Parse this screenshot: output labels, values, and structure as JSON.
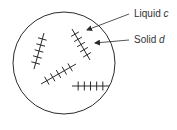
{
  "diagram": {
    "type": "solidification-microstructure",
    "colors": {
      "stroke": "#2a2a2a",
      "text": "#333333",
      "background": "#ffffff"
    },
    "boundary": {
      "shape": "circle",
      "cx": 64,
      "cy": 63,
      "r": 51
    },
    "labels": [
      {
        "id": "liquid",
        "prefix": "Liquid",
        "variable": "c",
        "text_x": 134,
        "text_y": 9,
        "leader": {
          "x1": 129,
          "y1": 14,
          "x2": 87,
          "y2": 30
        }
      },
      {
        "id": "solid",
        "prefix": "Solid",
        "variable": "d",
        "text_x": 134,
        "text_y": 35,
        "leader": {
          "x1": 129,
          "y1": 40,
          "x2": 95,
          "y2": 43
        }
      }
    ],
    "dendrites": [
      {
        "name": "dendrite-left",
        "x1": 44,
        "y1": 33,
        "x2": 34,
        "y2": 69,
        "ticks": 5,
        "tick_len": 9
      },
      {
        "name": "dendrite-upper-right",
        "x1": 72,
        "y1": 29,
        "x2": 90,
        "y2": 60,
        "ticks": 5,
        "tick_len": 9
      },
      {
        "name": "dendrite-middle",
        "x1": 41,
        "y1": 84,
        "x2": 76,
        "y2": 64,
        "ticks": 5,
        "tick_len": 9
      },
      {
        "name": "dendrite-lower-right",
        "x1": 72,
        "y1": 86,
        "x2": 109,
        "y2": 86,
        "ticks": 5,
        "tick_len": 9
      }
    ]
  }
}
